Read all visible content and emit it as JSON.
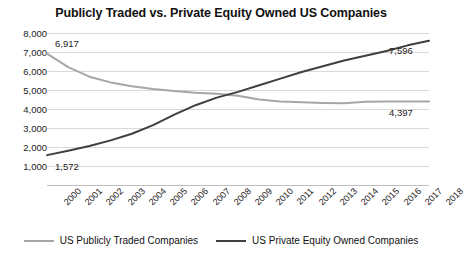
{
  "chart_data": {
    "type": "line",
    "title": "Publicly Traded vs. Private Equity Owned US Companies",
    "xlabel": "",
    "ylabel": "",
    "grid": true,
    "legend_position": "bottom",
    "ylim": [
      0,
      8000
    ],
    "ytick_labels": [
      "8,000",
      "7,000",
      "6,000",
      "5,000",
      "4,000",
      "3,000",
      "2,000",
      "1,000"
    ],
    "ytick_values": [
      8000,
      7000,
      6000,
      5000,
      4000,
      3000,
      2000,
      1000
    ],
    "categories": [
      "2000",
      "2001",
      "2002",
      "2003",
      "2004",
      "2005",
      "2006",
      "2007",
      "2008",
      "2009",
      "2010",
      "2011",
      "2012",
      "2013",
      "2014",
      "2015",
      "2016",
      "2017",
      "2018"
    ],
    "series": [
      {
        "name": "US Publicly Traded Companies",
        "color": "#a6a6a6",
        "values": [
          6917,
          6200,
          5700,
          5400,
          5200,
          5050,
          4950,
          4850,
          4800,
          4700,
          4500,
          4400,
          4350,
          4320,
          4300,
          4380,
          4400,
          4390,
          4397
        ]
      },
      {
        "name": "US Private Equity Owned Companies",
        "color": "#3f3f3f",
        "values": [
          1572,
          1800,
          2050,
          2350,
          2700,
          3150,
          3700,
          4200,
          4600,
          4900,
          5250,
          5600,
          5950,
          6250,
          6550,
          6800,
          7050,
          7350,
          7596
        ]
      }
    ],
    "data_labels": [
      {
        "text": "6,917",
        "series": "US Publicly Traded Companies",
        "category": "2000",
        "value": 6917
      },
      {
        "text": "1,572",
        "series": "US Private Equity Owned Companies",
        "category": "2000",
        "value": 1572
      },
      {
        "text": "7,596",
        "series": "US Private Equity Owned Companies",
        "category": "2018",
        "value": 7596
      },
      {
        "text": "4,397",
        "series": "US Publicly Traded Companies",
        "category": "2018",
        "value": 4397
      }
    ]
  },
  "legend": {
    "items": [
      {
        "label": "US Publicly Traded Companies",
        "color": "#a6a6a6"
      },
      {
        "label": "US Private Equity Owned Companies",
        "color": "#3f3f3f"
      }
    ]
  }
}
